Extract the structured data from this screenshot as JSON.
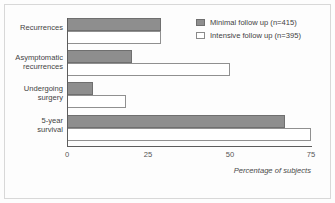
{
  "chart_data": {
    "type": "bar",
    "orientation": "horizontal",
    "title": "",
    "subtitle": "",
    "xlabel": "Percentage of subjects",
    "ylabel": "",
    "xlim": [
      0,
      75
    ],
    "xticks": [
      "0",
      "25",
      "50",
      "75"
    ],
    "xtick_values": [
      0,
      25,
      50,
      75
    ],
    "grid": false,
    "legend_position": "top-right",
    "categories": [
      "Recurrences",
      "Asymptomatic recurrences",
      "Undergoing surgery",
      "5-year survival"
    ],
    "category_lines": [
      [
        "Recurrences"
      ],
      [
        "Asymptomatic",
        "recurrences"
      ],
      [
        "Undergoing",
        "surgery"
      ],
      [
        "5-year",
        "survival"
      ]
    ],
    "series": [
      {
        "name": "Minimal follow up (n=415)",
        "color": "#8e8e8e",
        "values": [
          29,
          20,
          8,
          67
        ]
      },
      {
        "name": "Intensive follow up (n=395)",
        "color": "#ffffff",
        "values": [
          29,
          50,
          18,
          75
        ]
      }
    ]
  },
  "legend": {
    "items": [
      {
        "label": "Minimal follow up (n=415)",
        "swatch": "minimal"
      },
      {
        "label": "Intensive follow up (n=395)",
        "swatch": "intensive"
      }
    ]
  },
  "axis": {
    "tick_0": "0",
    "tick_1": "25",
    "tick_2": "50",
    "tick_3": "75",
    "x_axis_label": "Percentage of subjects"
  },
  "categories": {
    "c0_l0": "Recurrences",
    "c1_l0": "Asymptomatic",
    "c1_l1": "recurrences",
    "c2_l0": "Undergoing",
    "c2_l1": "surgery",
    "c3_l0": "5-year",
    "c3_l1": "survival"
  },
  "colors": {
    "minimal_fill": "#8e8e8e",
    "minimal_border": "#6f6f6f",
    "intensive_fill": "#ffffff",
    "intensive_border": "#909090",
    "axis": "#5d5d5d",
    "frame": "#d8d8d8"
  }
}
